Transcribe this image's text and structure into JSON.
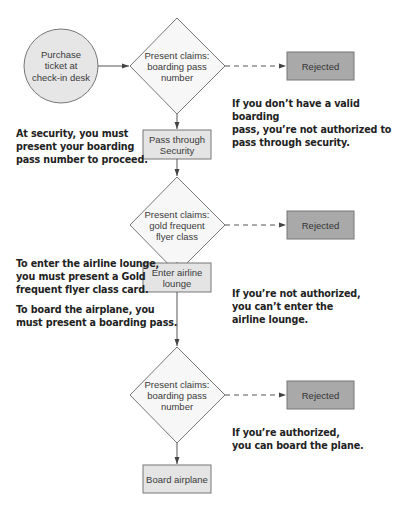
{
  "diagram": {
    "type": "flowchart",
    "start": {
      "label": "Purchase\nticket at\ncheck-in desk"
    },
    "decisions": [
      {
        "label": "Present claims:\nboarding pass\nnumber"
      },
      {
        "label": "Present claims:\ngold frequent\nflyer class"
      },
      {
        "label": "Present claims:\nboarding pass\nnumber"
      }
    ],
    "steps": [
      {
        "label": "Pass through\nSecurity"
      },
      {
        "label": "Enter airline\nlounge"
      },
      {
        "label": "Board airplane"
      }
    ],
    "rejections": [
      {
        "label": "Rejected"
      },
      {
        "label": "Rejected"
      },
      {
        "label": "Rejected"
      }
    ],
    "notes": {
      "invalid_pass": "If you don’t have a valid boarding\npass, you’re not authorized to\npass through security.",
      "at_security": "At security, you must\npresent your boarding\npass number to proceed.",
      "lounge_requirement": "To enter the airline lounge,\nyou must present a Gold\nfrequent flyer class card.",
      "lounge_denied": "If you’re not authorized,\nyou can’t enter the\nairline lounge.",
      "board_requirement": "To board the airplane, you\nmust present a boarding pass.",
      "board_allowed": "If you’re authorized,\nyou can board the plane."
    },
    "colors": {
      "start_fill": "#e6e6e6",
      "decision_fill": "#f7f7f7",
      "step_fill": "#e4e4e4",
      "rejected_fill": "#a9a9a9",
      "stroke": "#6e6e6e",
      "arrow": "#555555"
    }
  }
}
